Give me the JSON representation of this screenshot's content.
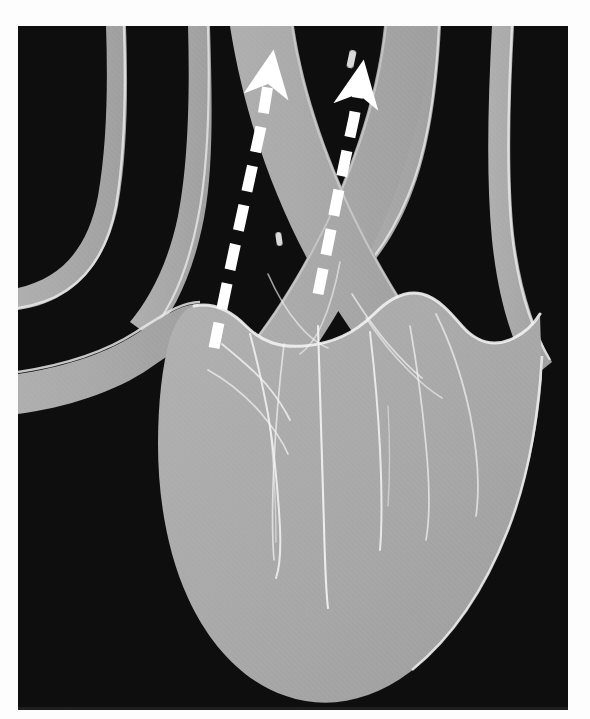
{
  "figure": {
    "kind": "anatomical-illustration",
    "caption": "",
    "plate_background": "#0e0e0e",
    "page_background": "#fdfdfd"
  },
  "palette": {
    "background_dark": "#0e0e0e",
    "tissue_gray": "#a9a9a9",
    "tissue_gray_shadow": "#9d9d9d",
    "tissue_gray_light": "#b4b4b4",
    "outline_white": "#f2f2f2",
    "arrow_white": "#ffffff"
  },
  "plate": {
    "x": 18,
    "y": 26,
    "width": 550,
    "height": 684
  },
  "annotations": {
    "flow_arrows": [
      {
        "id": "left-flow-arrow",
        "label": "",
        "direction": "up-left",
        "style": "dashed",
        "color": "#ffffff",
        "dash_length": 26,
        "dash_gap": 14,
        "stroke_width": 11,
        "start": [
          239,
          296
        ],
        "end": [
          260,
          32
        ],
        "head_at": "end"
      },
      {
        "id": "right-flow-arrow",
        "label": "",
        "direction": "up-right",
        "style": "dashed",
        "color": "#ffffff",
        "dash_length": 26,
        "dash_gap": 14,
        "stroke_width": 11,
        "start": [
          320,
          244
        ],
        "end": [
          348,
          41
        ],
        "head_at": "end"
      }
    ]
  },
  "structures": {
    "vessels": [
      {
        "id": "vessel-upper-left-outer",
        "name": "upper-left-vessel-outer",
        "tone": "#a9a9a9"
      },
      {
        "id": "vessel-upper-left-inner",
        "name": "upper-left-vessel-inner",
        "tone": "#a9a9a9"
      },
      {
        "id": "vessel-upper-right-inner",
        "name": "upper-right-vessel-inner",
        "tone": "#a9a9a9"
      },
      {
        "id": "vessel-upper-right-outer",
        "name": "upper-right-vessel-outer",
        "tone": "#a9a9a9"
      },
      {
        "id": "vessel-left-lateral",
        "name": "left-lateral-vessel",
        "tone": "#a9a9a9"
      },
      {
        "id": "vessel-trunk-left",
        "name": "crossing-trunk-left",
        "tone": "#a9a9a9"
      },
      {
        "id": "vessel-trunk-right",
        "name": "crossing-trunk-right",
        "tone": "#a9a9a9"
      }
    ],
    "chambers": [
      {
        "id": "heart-body",
        "name": "heart-body-mass",
        "tone": "#a9a9a9"
      },
      {
        "id": "chamber-left",
        "name": "left-chamber-outline",
        "tone": "#f2f2f2"
      },
      {
        "id": "chamber-right",
        "name": "right-chamber-outline",
        "tone": "#f2f2f2"
      },
      {
        "id": "septum",
        "name": "interventricular-septum",
        "tone": "#f2f2f2"
      }
    ]
  }
}
